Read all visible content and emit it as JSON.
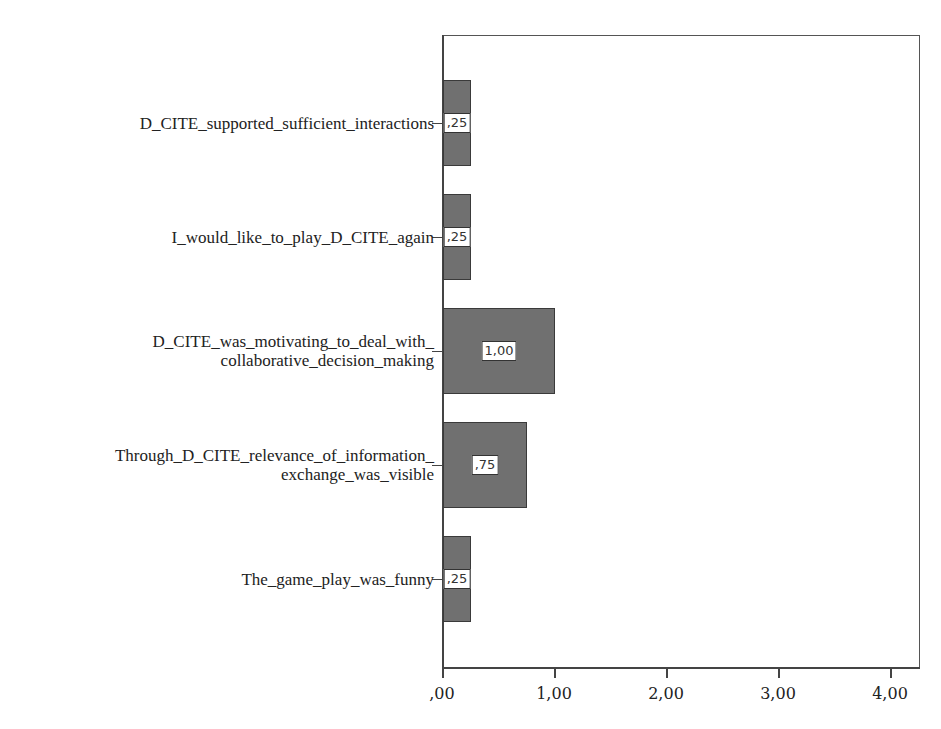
{
  "chart_data": {
    "type": "bar",
    "orientation": "horizontal",
    "title": "",
    "xlabel": "",
    "ylabel": "",
    "categories": [
      "D_CITE_supported_sufficient_interactions",
      "I_would_like_to_play_D_CITE_again",
      "D_CITE_was_motivating_to_deal_with_\ncollaborative_decision_making",
      "Through_D_CITE_relevance_of_information_\nexchange_was_visible",
      "The_game_play_was_funny"
    ],
    "values": [
      0.25,
      0.25,
      1.0,
      0.75,
      0.25
    ],
    "value_labels": [
      ",25",
      ",25",
      "1,00",
      ",75",
      ",25"
    ],
    "xticks": [
      ",00",
      "1,00",
      "2,00",
      "3,00",
      "4,00"
    ],
    "xlim": [
      0,
      4.2
    ],
    "grid": false,
    "legend": null,
    "bar_color": "#707070"
  }
}
